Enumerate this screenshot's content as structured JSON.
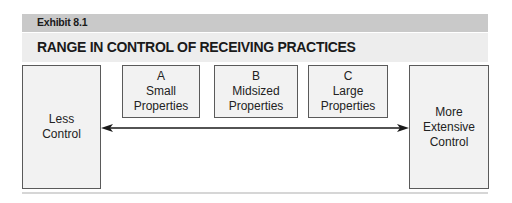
{
  "exhibit": {
    "label": "Exhibit 8.1",
    "title": "RANGE IN CONTROL OF RECEIVING PRACTICES"
  },
  "endpoints": {
    "left": {
      "lines": [
        "Less",
        "Control"
      ]
    },
    "right": {
      "lines": [
        "More",
        "Extensive",
        "Control"
      ]
    }
  },
  "categories": [
    {
      "letter": "A",
      "lines": [
        "Small",
        "Properties"
      ]
    },
    {
      "letter": "B",
      "lines": [
        "Midsized",
        "Properties"
      ]
    },
    {
      "letter": "C",
      "lines": [
        "Large",
        "Properties"
      ]
    }
  ],
  "arrow": {
    "type": "double-headed",
    "color": "#1a1a1a"
  },
  "colors": {
    "exhibit_bar": "#c9c9c9",
    "title_band": "#ededed",
    "box_fill": "#f2f2f2",
    "box_border": "#5a5a5a"
  }
}
